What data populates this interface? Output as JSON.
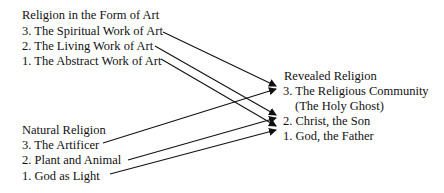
{
  "art_group": {
    "heading": "Religion in the Form of Art",
    "items": [
      "3. The Spiritual Work of Art",
      "2. The Living Work of Art",
      "1. The Abstract Work of Art"
    ]
  },
  "natural_group": {
    "heading": "Natural Religion",
    "items": [
      "3. The Artificer",
      "2. Plant and Animal",
      "1. God as Light"
    ]
  },
  "revealed_group": {
    "heading": "Revealed Religion",
    "items": [
      "3. The Religious Community",
      "(The Holy Ghost)",
      "2. Christ, the Son",
      "1. God, the Father"
    ]
  },
  "connections": [
    {
      "from": "3. The Spiritual Work of Art",
      "to": "3. The Religious Community"
    },
    {
      "from": "2. The Living Work of Art",
      "to": "2. Christ, the Son"
    },
    {
      "from": "1. The Abstract Work of Art",
      "to": "1. God, the Father"
    },
    {
      "from": "3. The Artificer",
      "to": "3. The Religious Community"
    },
    {
      "from": "2. Plant and Animal",
      "to": "2. Christ, the Son"
    },
    {
      "from": "1. God as Light",
      "to": "1. God, the Father"
    }
  ]
}
